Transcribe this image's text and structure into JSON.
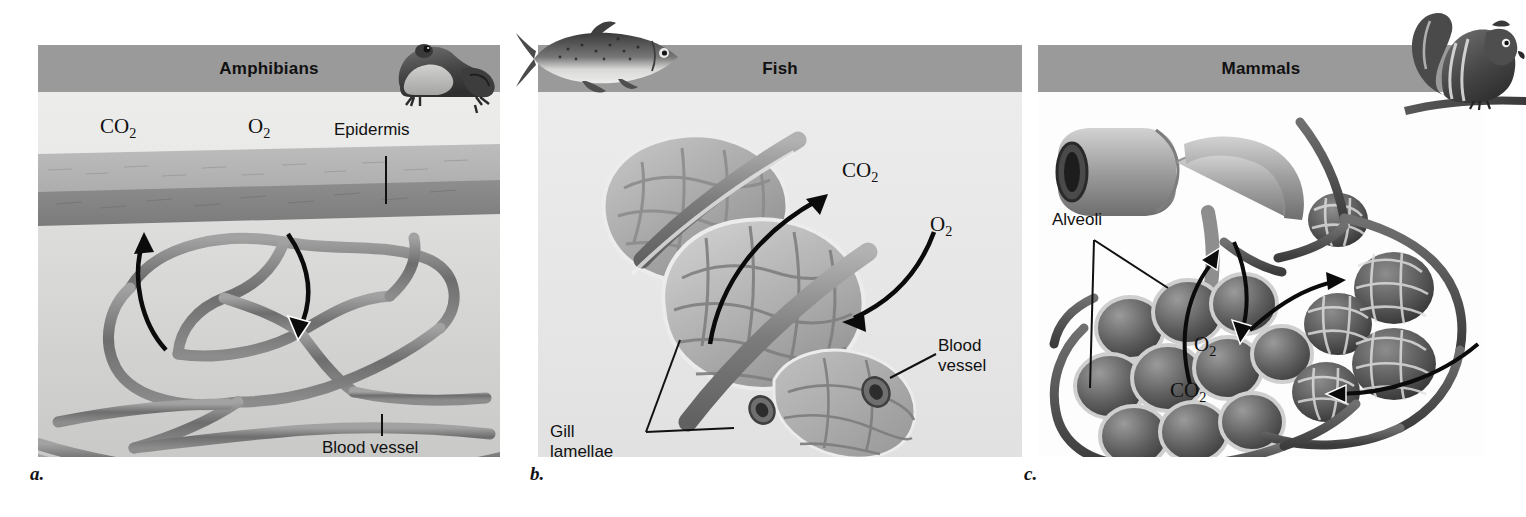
{
  "figure": {
    "kind": "comparative-anatomy-figure",
    "style": "grayscale textbook illustration",
    "panel_count": 3
  },
  "panels": [
    {
      "letter": "a.",
      "title": "Amphibians",
      "animal_icon": "frog-illustration",
      "background": "#e7e7e6",
      "header_color": "#9a9a9a",
      "labels": [
        {
          "name": "co2-label",
          "text": "CO₂"
        },
        {
          "name": "o2-label",
          "text": "O₂"
        },
        {
          "name": "epidermis-label",
          "text": "Epidermis"
        },
        {
          "name": "blood-vessel-label",
          "text": "Blood vessel"
        }
      ],
      "structures": [
        "epidermis",
        "capillary-network",
        "blood-vessel"
      ]
    },
    {
      "letter": "b.",
      "title": "Fish",
      "animal_icon": "fish-illustration",
      "background": "#e6e6e6",
      "header_color": "#9a9a9a",
      "labels": [
        {
          "name": "co2-label",
          "text": "CO₂"
        },
        {
          "name": "o2-label",
          "text": "O₂"
        },
        {
          "name": "blood-vessel-label",
          "text": "Blood\nvessel"
        },
        {
          "name": "gill-lamellae-label",
          "text": "Gill\nlamellae"
        }
      ],
      "structures": [
        "gill-lamellae",
        "capillary-network",
        "blood-vessel"
      ]
    },
    {
      "letter": "c.",
      "title": "Mammals",
      "animal_icon": "chipmunk-illustration",
      "background": "#fdfdfd",
      "header_color": "#9a9a9a",
      "labels": [
        {
          "name": "alveoli-label",
          "text": "Alveoli"
        },
        {
          "name": "o2-label",
          "text": "O₂"
        },
        {
          "name": "co2-label",
          "text": "CO₂"
        }
      ],
      "structures": [
        "bronchiole",
        "alveoli-cluster",
        "capillary-network"
      ]
    }
  ]
}
